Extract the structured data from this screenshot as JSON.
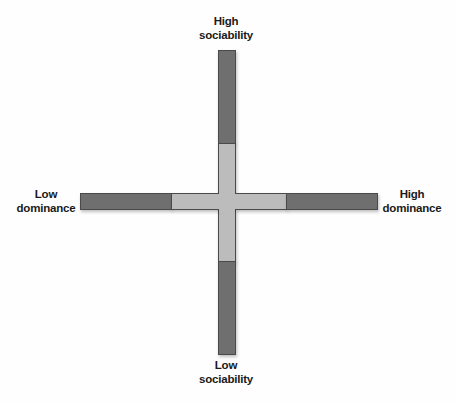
{
  "diagram": {
    "type": "quadrant-cross",
    "axes": {
      "vertical": {
        "top_label": [
          "High",
          "sociability"
        ],
        "bottom_label": [
          "Low",
          "sociability"
        ]
      },
      "horizontal": {
        "left_label": [
          "Low",
          "dominance"
        ],
        "right_label": [
          "High",
          "dominance"
        ]
      }
    },
    "colors": {
      "outer_segment": "#6f6f6f",
      "inner_segment": "#bcbcbc",
      "border": "#4a4a4a",
      "background": "#fefefe"
    }
  }
}
